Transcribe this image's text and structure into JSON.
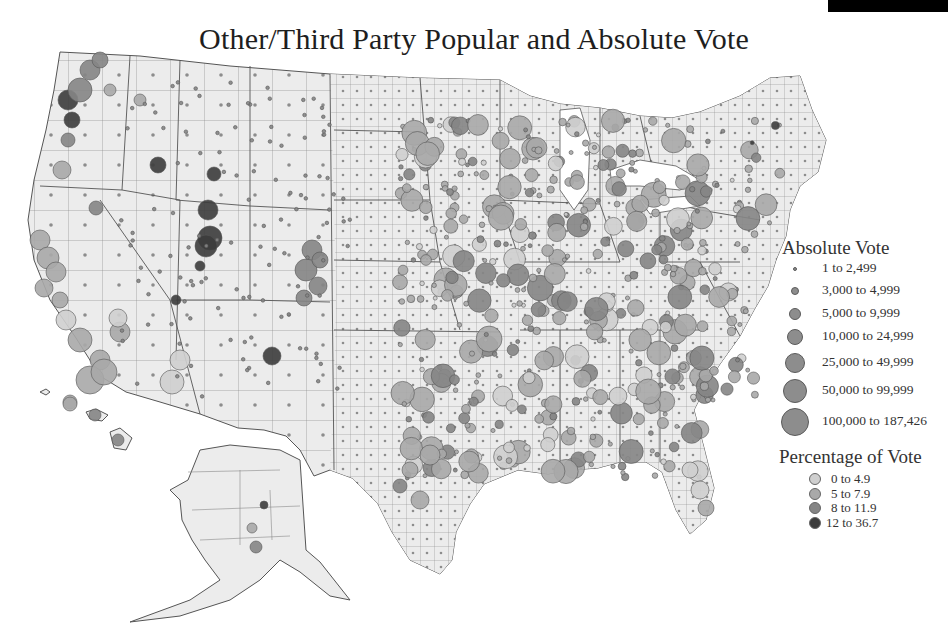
{
  "title": "Other/Third Party Popular and Absolute Vote",
  "colors": {
    "land": "#ececec",
    "borders": "#6e6e6e",
    "pct_0_4_9": "#cfcfcf",
    "pct_5_7_9": "#a9a9a9",
    "pct_8_11_9": "#858585",
    "pct_12_36_7": "#3c3c3c"
  },
  "legend_absolute": {
    "title": "Absolute Vote",
    "items": [
      {
        "label": "1 to 2,499",
        "size": 4
      },
      {
        "label": "3,000 to 4,999",
        "size": 8
      },
      {
        "label": "5,000 to 9,999",
        "size": 12
      },
      {
        "label": "10,000 to 24,999",
        "size": 16
      },
      {
        "label": "25,000 to 49,999",
        "size": 20
      },
      {
        "label": "50,000 to 99,999",
        "size": 24
      },
      {
        "label": "100,000 to 187,426",
        "size": 28
      }
    ]
  },
  "legend_percentage": {
    "title": "Percentage of Vote",
    "items": [
      {
        "label": "0 to 4.9",
        "color": "#cfcfcf"
      },
      {
        "label": "5 to 7.9",
        "color": "#a9a9a9"
      },
      {
        "label": "8 to 11.9",
        "color": "#858585"
      },
      {
        "label": "12 to 36.7",
        "color": "#3c3c3c"
      }
    ]
  }
}
